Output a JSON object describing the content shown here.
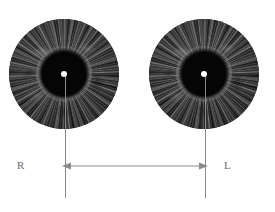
{
  "figure": {
    "background_color": "#ffffff",
    "width": 275,
    "height": 212
  },
  "eyes": [
    {
      "id": "right-eye",
      "side_label": "R",
      "side_name": "Right",
      "iris_color": "#3e3e3e",
      "pupil_color": "#050505",
      "reflex_color": "#ffffff"
    },
    {
      "id": "left-eye",
      "side_label": "L",
      "side_name": "Left",
      "iris_color": "#3e3e3e",
      "pupil_color": "#050505",
      "reflex_color": "#ffffff"
    }
  ],
  "measurement": {
    "arrow_color": "#8a8a8a",
    "axis_color": "#8a8a8a",
    "arrow_style": "double-headed",
    "label_color": "#6b6b6b"
  },
  "labels": {
    "right": "R",
    "left": "L"
  }
}
